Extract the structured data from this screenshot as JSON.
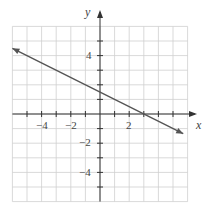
{
  "chart_data": {
    "type": "line",
    "title": "",
    "xlabel": "x",
    "ylabel": "y",
    "xlim": [
      -6,
      6
    ],
    "ylim": [
      -6,
      6
    ],
    "grid": true,
    "x_tick_labels": [
      "-4",
      "-2",
      "2"
    ],
    "y_tick_labels": [
      "4",
      "-2",
      "-4"
    ],
    "series": [
      {
        "name": "line",
        "equation": "y = -x/2 + 3/2",
        "x": [
          -6,
          5.7
        ],
        "y": [
          4.5,
          -1.35
        ],
        "arrows": "both"
      }
    ],
    "key_points": {
      "x_intercept": [
        3,
        0
      ],
      "y_intercept": [
        0,
        1.5
      ]
    }
  },
  "labels": {
    "x_axis": "x",
    "y_axis": "y",
    "xt_m4": "−4",
    "xt_m2": "−2",
    "xt_2": "2",
    "yt_4": "4",
    "yt_m2": "−2",
    "yt_m4": "−4"
  },
  "colors": {
    "grid": "#cfcfcf",
    "axis": "#333333",
    "line": "#555555"
  }
}
